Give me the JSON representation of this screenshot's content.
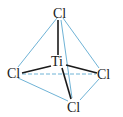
{
  "diagram": {
    "molecule": "TiCl4",
    "geometry": "tetrahedral",
    "colors": {
      "bond": "#1a1a1a",
      "edge": "#6fb3d6",
      "label": "#1a1a1a"
    },
    "atoms": {
      "center": {
        "label": "Ti"
      },
      "top": {
        "label": "Cl"
      },
      "left": {
        "label": "Cl"
      },
      "right": {
        "label": "Cl"
      },
      "bottom": {
        "label": "Cl"
      }
    }
  }
}
